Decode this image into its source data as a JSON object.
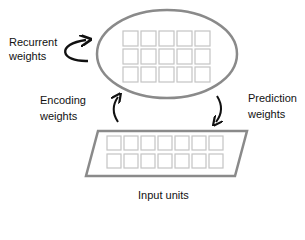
{
  "diagram": {
    "hidden_layer": {
      "rows": 3,
      "cols": 5
    },
    "input_layer": {
      "rows": 2,
      "cols": 7,
      "label": "Input units"
    },
    "labels": {
      "recurrent_line1": "Recurrent",
      "recurrent_line2": "weights",
      "encoding_line1": "Encoding",
      "encoding_line2": "weights",
      "prediction_line1": "Prediction",
      "prediction_line2": "weights",
      "input_units": "Input units"
    },
    "colors": {
      "outline": "#8a8a8a",
      "cell": "#c4c4c4",
      "arrow": "#111111",
      "text": "#111111"
    }
  }
}
